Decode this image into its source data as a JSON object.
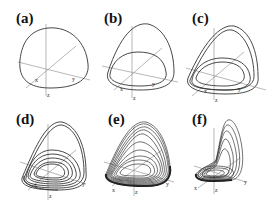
{
  "figure": {
    "panels": [
      {
        "label": "(a)",
        "axes": {
          "x": "x",
          "y": "y",
          "z": "z"
        },
        "loops": 1
      },
      {
        "label": "(b)",
        "axes": {
          "x": "x",
          "y": "y",
          "z": "z"
        },
        "loops": 2
      },
      {
        "label": "(c)",
        "axes": {
          "x": "x",
          "y": "y",
          "z": "z"
        },
        "loops": 4
      },
      {
        "label": "(d)",
        "axes": {
          "x": "x",
          "y": "y",
          "z": "z"
        },
        "loops": 8
      },
      {
        "label": "(e)",
        "axes": {
          "x": "x",
          "y": "y",
          "z": "z"
        },
        "loops": "chaotic"
      },
      {
        "label": "(f)",
        "axes": {
          "x": "x",
          "y": "y",
          "z": "z"
        },
        "loops": "chaotic"
      }
    ],
    "colors": {
      "curve": "#333333",
      "axis": "#777777",
      "background": "#ffffff"
    }
  }
}
